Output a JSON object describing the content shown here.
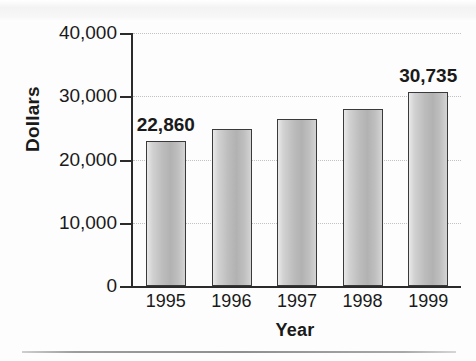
{
  "chart_data": {
    "type": "bar",
    "title": "",
    "subtitle": "",
    "xlabel": "Year",
    "ylabel": "Dollars",
    "categories": [
      "1995",
      "1996",
      "1997",
      "1998",
      "1999"
    ],
    "values": [
      22860,
      24800,
      26400,
      28000,
      30735
    ],
    "value_labels": [
      "22,860",
      "",
      "",
      "",
      "30,735"
    ],
    "ylim": [
      0,
      40000
    ],
    "ytick_values": [
      0,
      10000,
      20000,
      30000,
      40000
    ],
    "ytick_labels": [
      "0",
      "10,000",
      "20,000",
      "30,000",
      "40,000"
    ],
    "grid": "dotted-horizontal",
    "legend": "none",
    "series_name": "Dollars",
    "bar_fill": "#bdbdbd",
    "bar_border": "#3a3a3a",
    "axis_color": "#2b2b2b",
    "grid_color": "#c2c2c2",
    "background": "#fdfdfd"
  }
}
